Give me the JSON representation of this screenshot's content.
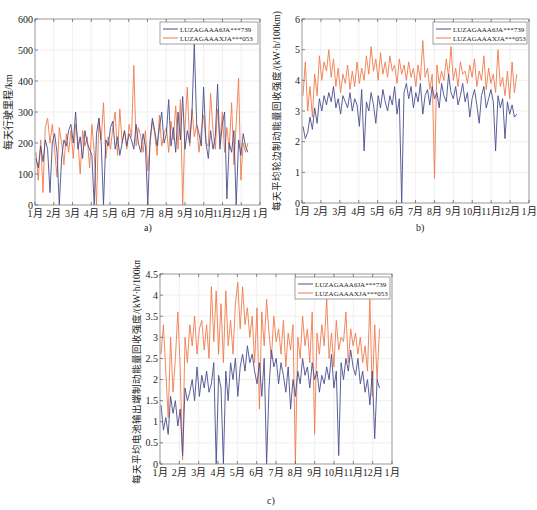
{
  "colors": {
    "series1": "#4a4e8c",
    "series2": "#f07a4c",
    "grid": "#e6e6e6",
    "axis": "#555555"
  },
  "chart_data": [
    {
      "id": "a",
      "type": "line",
      "caption": "a)",
      "title": "",
      "xlabel": "",
      "ylabel": "每天行驶里程/km",
      "ylim": [
        0,
        600
      ],
      "yticks": [
        "0",
        "100",
        "200",
        "300",
        "400",
        "500",
        "600"
      ],
      "xticks": [
        "1月",
        "2月",
        "3月",
        "4月",
        "5月",
        "6月",
        "7月",
        "8月",
        "9月",
        "10月",
        "11月",
        "12月",
        "1月"
      ],
      "grid": true,
      "legend": {
        "position": "upper right",
        "entries": [
          "LUZAGAAA6JA***739",
          "LUZAGAAAXJA***053"
        ]
      },
      "series": [
        {
          "name": "LUZAGAAA6JA***739",
          "values": [
            150,
            120,
            190,
            140,
            210,
            180,
            40,
            200,
            230,
            170,
            0,
            150,
            210,
            190,
            240,
            260,
            200,
            300,
            180,
            220,
            150,
            240,
            200,
            180,
            160,
            0,
            230,
            280,
            200,
            0,
            210,
            190,
            250,
            270,
            180,
            220,
            160,
            200,
            240,
            190,
            230,
            210,
            180,
            260,
            200,
            170,
            230,
            190,
            0,
            210,
            280,
            240,
            190,
            250,
            300,
            200,
            230,
            340,
            190,
            250,
            170,
            300,
            210,
            350,
            180,
            240,
            200,
            300,
            520,
            260,
            230,
            190,
            380,
            200,
            150,
            240,
            180,
            220,
            390,
            180,
            260,
            300,
            20,
            200,
            170,
            240,
            0,
            210,
            160,
            230,
            190,
            170
          ]
        },
        {
          "name": "LUZAGAAAXJA***053",
          "values": [
            170,
            80,
            210,
            40,
            250,
            280,
            200,
            260,
            180,
            90,
            250,
            200,
            130,
            230,
            170,
            240,
            150,
            260,
            210,
            100,
            240,
            190,
            220,
            120,
            260,
            170,
            0,
            280,
            210,
            330,
            150,
            220,
            180,
            250,
            300,
            160,
            310,
            200,
            240,
            180,
            260,
            220,
            450,
            190,
            250,
            220,
            170,
            240,
            110,
            200,
            270,
            230,
            160,
            290,
            190,
            230,
            250,
            170,
            270,
            210,
            320,
            180,
            340,
            0,
            250,
            380,
            190,
            310,
            220,
            260,
            170,
            240,
            290,
            200,
            190,
            360,
            240,
            180,
            310,
            200,
            300,
            170,
            250,
            180,
            330,
            130,
            260,
            410,
            80,
            200,
            170,
            200
          ]
        }
      ]
    },
    {
      "id": "b",
      "type": "line",
      "caption": "b)",
      "title": "",
      "xlabel": "",
      "ylabel": "每天平均轮边制动能量回收强度/(kW·h/100km)",
      "ylim": [
        0,
        6
      ],
      "yticks": [
        "0",
        "1",
        "2",
        "3",
        "4",
        "5",
        "6"
      ],
      "xticks": [
        "1月",
        "2月",
        "3月",
        "4月",
        "5月",
        "6月",
        "7月",
        "8月",
        "9月",
        "10月",
        "11月",
        "12月",
        "1月"
      ],
      "grid": true,
      "legend": {
        "position": "upper right",
        "entries": [
          "LUZAGAAA6JA***739",
          "LUZAGAAAXJA***053"
        ]
      },
      "series": [
        {
          "name": "LUZAGAAA6JA***739",
          "values": [
            2.5,
            2.1,
            2.3,
            2.8,
            2.4,
            3.1,
            2.6,
            3.4,
            3.0,
            3.5,
            3.2,
            3.6,
            3.3,
            3.8,
            3.1,
            3.4,
            2.9,
            3.5,
            3.3,
            3.1,
            3.6,
            3.0,
            3.4,
            3.2,
            2.5,
            3.7,
            1.7,
            3.3,
            3.0,
            3.6,
            3.2,
            2.6,
            3.5,
            3.1,
            3.7,
            3.3,
            3.0,
            3.5,
            3.2,
            3.8,
            2.9,
            3.4,
            0,
            3.6,
            3.9,
            3.4,
            3.8,
            3.1,
            3.6,
            3.3,
            3.9,
            2.9,
            3.5,
            3.7,
            3.2,
            3.8,
            3.4,
            3.6,
            3.1,
            3.9,
            3.5,
            3.3,
            4.2,
            3.6,
            3.4,
            3.8,
            3.2,
            3.5,
            3.9,
            3.3,
            3.6,
            2.8,
            3.4,
            3.7,
            3.2,
            2.6,
            3.5,
            3.8,
            3.1,
            3.4,
            3.7,
            3.3,
            1.7,
            3.5,
            3.1,
            3.4,
            2.1,
            3.3,
            2.9,
            3.2,
            2.8,
            2.9
          ]
        },
        {
          "name": "LUZAGAAAXJA***053",
          "values": [
            3.5,
            4.6,
            3.0,
            3.8,
            2.8,
            4.2,
            3.5,
            4.8,
            4.0,
            4.6,
            4.3,
            5.0,
            4.1,
            4.7,
            3.8,
            4.4,
            3.6,
            4.2,
            3.9,
            4.5,
            3.7,
            4.3,
            3.8,
            4.6,
            3.9,
            4.4,
            4.0,
            4.8,
            4.2,
            5.1,
            4.3,
            4.7,
            4.0,
            4.9,
            4.2,
            4.6,
            4.1,
            4.8,
            4.3,
            4.5,
            3.9,
            4.7,
            4.2,
            4.5,
            4.0,
            4.6,
            4.1,
            4.4,
            3.8,
            4.5,
            4.0,
            5.3,
            4.1,
            4.4,
            3.7,
            4.2,
            0.8,
            4.5,
            3.9,
            4.3,
            4.0,
            4.7,
            4.1,
            5.1,
            4.0,
            4.4,
            3.8,
            4.6,
            4.2,
            4.3,
            3.9,
            4.5,
            4.1,
            4.7,
            3.8,
            4.3,
            4.0,
            4.8,
            3.7,
            4.4,
            3.9,
            4.2,
            3.6,
            5.0,
            3.8,
            4.1,
            3.5,
            4.3,
            3.4,
            4.6,
            3.6,
            4.2
          ]
        }
      ]
    },
    {
      "id": "c",
      "type": "line",
      "caption": "c)",
      "title": "",
      "xlabel": "",
      "ylabel": "每天平均电池输出端制动能量回收强度/(kW·h/100km)",
      "ylim": [
        0,
        4.5
      ],
      "yticks": [
        "0",
        "0.5",
        "1",
        "1.5",
        "2",
        "2.5",
        "3",
        "3.5",
        "4",
        "4.5"
      ],
      "xticks": [
        "1月",
        "2月",
        "3月",
        "4月",
        "5月",
        "6月",
        "7月",
        "8月",
        "9月",
        "10月",
        "11月",
        "12月",
        "1月"
      ],
      "grid": true,
      "legend": {
        "position": "upper right",
        "entries": [
          "LUZAGAAA6JA***739",
          "LUZAGAAAXJA***053"
        ]
      },
      "series": [
        {
          "name": "LUZAGAAA6JA***739",
          "values": [
            1.4,
            0.8,
            1.1,
            0.7,
            1.6,
            1.2,
            1.5,
            0.9,
            1.3,
            0.2,
            1.8,
            1.5,
            1.7,
            2.0,
            1.5,
            2.3,
            1.6,
            2.1,
            1.8,
            2.2,
            1.7,
            1.9,
            2.4,
            0,
            2.1,
            1.8,
            0,
            2.2,
            1.5,
            2.4,
            2.0,
            2.5,
            1.6,
            2.3,
            2.6,
            2.2,
            2.8,
            2.4,
            2.6,
            2.2,
            1.9,
            2.4,
            1.6,
            2.5,
            0,
            1.8,
            2.7,
            2.3,
            2.5,
            1.9,
            2.4,
            2.1,
            1.7,
            2.3,
            1.3,
            2.0,
            1.6,
            2.2,
            1.9,
            2.5,
            2.1,
            2.3,
            1.8,
            2.4,
            2.0,
            2.2,
            1.7,
            2.1,
            1.9,
            2.3,
            2.0,
            2.6,
            1.8,
            2.2,
            0.2,
            2.4,
            2.0,
            2.5,
            2.2,
            2.7,
            2.3,
            2.1,
            2.5,
            1.9,
            2.2,
            1.7,
            2.0,
            1.4,
            2.2,
            0.6,
            2.0,
            1.8
          ]
        },
        {
          "name": "LUZAGAAAXJA***053",
          "values": [
            2.6,
            3.3,
            2.2,
            1.1,
            3.0,
            1.7,
            2.5,
            3.6,
            2.3,
            0.1,
            3.0,
            2.4,
            3.3,
            2.8,
            3.5,
            2.6,
            3.2,
            3.4,
            2.7,
            3.3,
            2.5,
            4.2,
            2.9,
            4.1,
            2.6,
            3.8,
            2.4,
            4.1,
            2.8,
            3.4,
            2.6,
            3.8,
            4.3,
            3.2,
            4.2,
            3.3,
            3.7,
            3.0,
            3.5,
            2.4,
            3.7,
            1.3,
            3.6,
            2.8,
            3.9,
            3.1,
            2.5,
            3.5,
            2.9,
            3.2,
            2.6,
            3.4,
            2.3,
            3.1,
            2.7,
            3.3,
            0,
            3.0,
            2.5,
            3.5,
            2.8,
            3.2,
            2.4,
            3.6,
            0.7,
            3.1,
            2.6,
            3.3,
            2.8,
            3.9,
            2.5,
            3.1,
            2.3,
            3.4,
            2.7,
            3.0,
            2.9,
            3.6,
            2.4,
            3.2,
            2.8,
            3.1,
            2.6,
            3.0,
            2.4,
            2.8,
            2.2,
            3.9,
            1.6,
            3.3,
            2.0,
            3.2
          ]
        }
      ]
    }
  ]
}
